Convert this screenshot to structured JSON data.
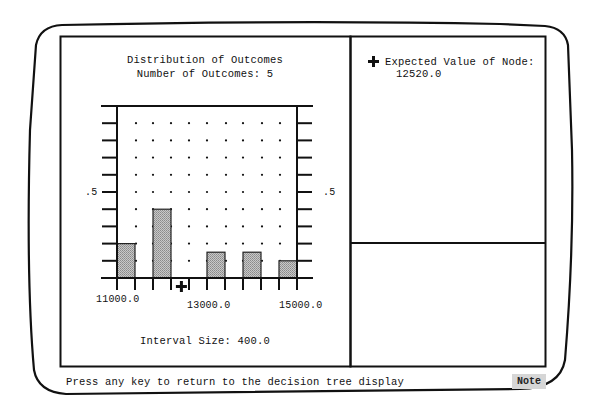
{
  "window": {
    "status_message": "Press any key to return to the decision tree display",
    "note_button": "Note"
  },
  "left_panel": {
    "title": "Distribution of Outcomes",
    "subtitle": "Number of Outcomes: 5",
    "y_label_left": ".5",
    "y_label_right": ".5",
    "x_tick_labels": [
      "11000.0",
      "13000.0",
      "15000.0"
    ],
    "interval_label": "Interval Size: 400.0"
  },
  "right_panel": {
    "marker_icon": "plus-marker-icon",
    "expected_value_label": "Expected Value of Node:",
    "expected_value": "12520.0"
  },
  "chart_data": {
    "type": "bar",
    "title": "Distribution of Outcomes",
    "subtitle": "Number of Outcomes: 5",
    "xlabel": "",
    "ylabel": "",
    "x_range": [
      11000,
      15000
    ],
    "x_tick_labels": [
      "11000.0",
      "13000.0",
      "15000.0"
    ],
    "interval_size": 400,
    "ylim": [
      0,
      1.0
    ],
    "y_tick_step": 0.1,
    "y_labeled_ticks": [
      {
        "value": 0.5,
        "label": ".5"
      }
    ],
    "grid": "dots",
    "bins": [
      {
        "from": 11000,
        "to": 11400,
        "value": 0.2
      },
      {
        "from": 11800,
        "to": 12200,
        "value": 0.4
      },
      {
        "from": 13000,
        "to": 13400,
        "value": 0.15
      },
      {
        "from": 13800,
        "to": 14200,
        "value": 0.15
      },
      {
        "from": 14600,
        "to": 15000,
        "value": 0.1
      }
    ],
    "expected_value_marker": {
      "x": 12520,
      "symbol": "+"
    },
    "annotations": [
      "Interval Size: 400.0"
    ]
  }
}
